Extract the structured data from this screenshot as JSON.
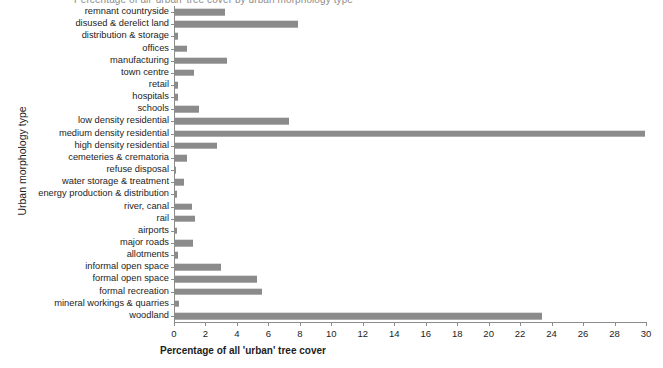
{
  "chart_data": {
    "type": "bar",
    "orientation": "horizontal",
    "title": "Percentage of all 'urban' tree cover by urban morphology type",
    "xlabel": "Percentage of all 'urban' tree cover",
    "ylabel": "Urban morphology type",
    "xlim": [
      0,
      30
    ],
    "xticks": [
      0,
      2,
      4,
      6,
      8,
      10,
      12,
      14,
      16,
      18,
      20,
      22,
      24,
      26,
      28,
      30
    ],
    "grid": false,
    "legend": null,
    "bar_color": "#8b8b8b",
    "axis_color": "#8c8c8c",
    "categories": [
      "remnant countryside",
      "disused & derelict land",
      "distribution & storage",
      "offices",
      "manufacturing",
      "town centre",
      "retail",
      "hospitals",
      "schools",
      "low density residential",
      "medium density residential",
      "high density residential",
      "cemeteries & crematoria",
      "refuse disposal",
      "water storage & treatment",
      "energy production & distribution",
      "river, canal",
      "rail",
      "airports",
      "major roads",
      "allotments",
      "informal open space",
      "formal open space",
      "formal recreation",
      "mineral workings & quarries",
      "woodland"
    ],
    "values": [
      3.2,
      7.8,
      0.2,
      0.75,
      3.3,
      1.2,
      0.2,
      0.2,
      1.55,
      7.25,
      29.9,
      2.7,
      0.75,
      0.05,
      0.6,
      0.1,
      1.05,
      1.3,
      0.1,
      1.15,
      0.2,
      2.9,
      5.2,
      5.5,
      0.25,
      23.3
    ]
  }
}
